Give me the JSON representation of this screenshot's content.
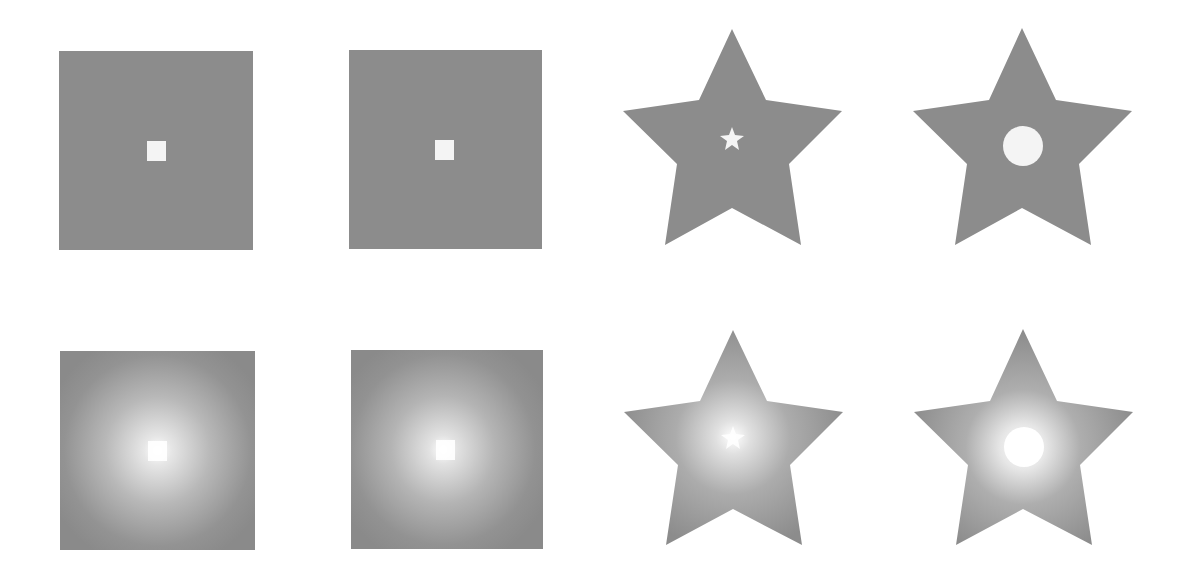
{
  "figure": {
    "background": "#ffffff",
    "shape_fill": "#8c8c8c",
    "highlight": "#f4f4f4",
    "panels": [
      {
        "row": 1,
        "col": 1,
        "shape": "square",
        "fill": "flat",
        "inner_shape": "square",
        "inner_position": "center"
      },
      {
        "row": 1,
        "col": 2,
        "shape": "square",
        "fill": "flat",
        "inner_shape": "square",
        "inner_position": "center-right"
      },
      {
        "row": 1,
        "col": 3,
        "shape": "star",
        "fill": "flat",
        "inner_shape": "star",
        "inner_position": "center"
      },
      {
        "row": 1,
        "col": 4,
        "shape": "star",
        "fill": "flat",
        "inner_shape": "circle",
        "inner_position": "center"
      },
      {
        "row": 2,
        "col": 1,
        "shape": "square",
        "fill": "radial-gradient",
        "inner_shape": "square",
        "inner_position": "center"
      },
      {
        "row": 2,
        "col": 2,
        "shape": "square",
        "fill": "radial-gradient",
        "inner_shape": "square",
        "inner_position": "center-right"
      },
      {
        "row": 2,
        "col": 3,
        "shape": "star",
        "fill": "radial-gradient",
        "inner_shape": "star",
        "inner_position": "center"
      },
      {
        "row": 2,
        "col": 4,
        "shape": "star",
        "fill": "radial-gradient",
        "inner_shape": "circle",
        "inner_position": "off-center"
      }
    ]
  }
}
